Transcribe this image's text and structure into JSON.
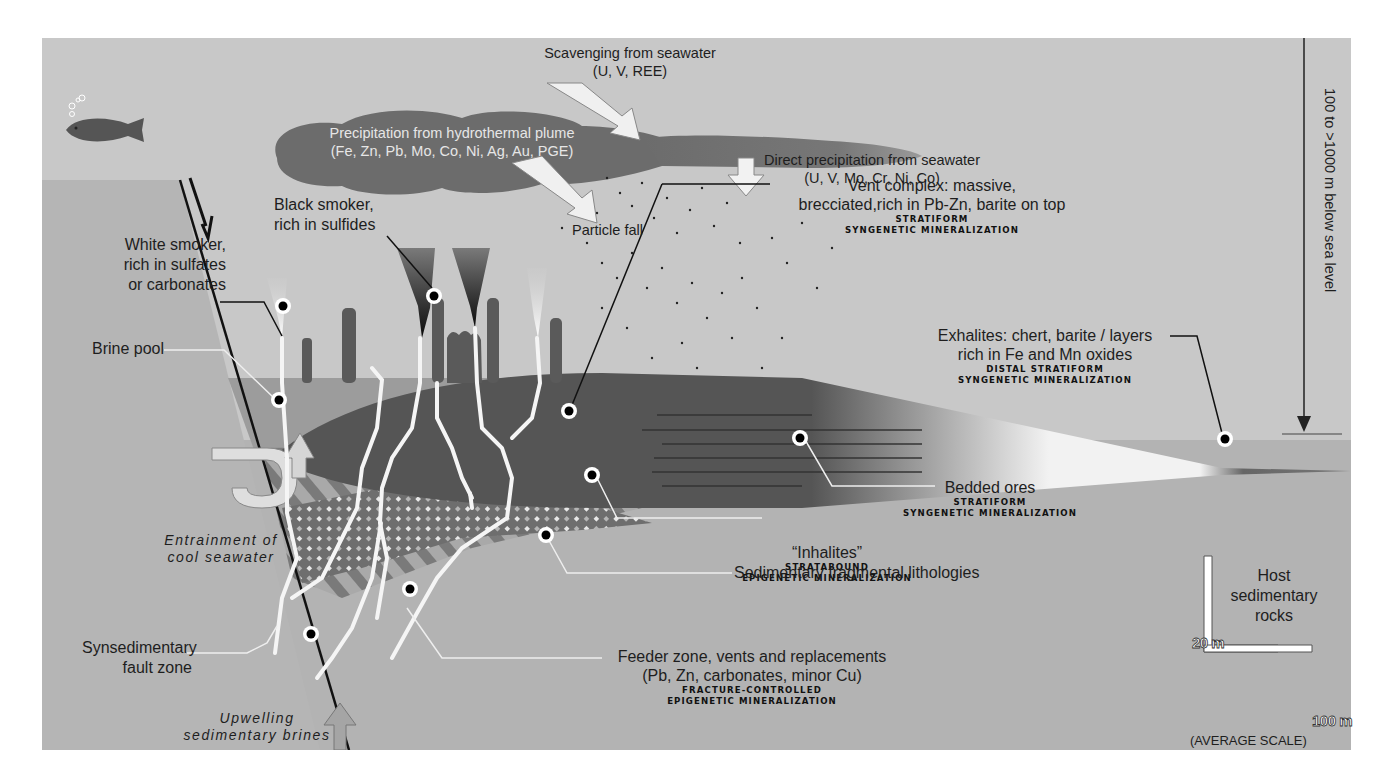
{
  "figure": {
    "type": "geological cross-section",
    "colors": {
      "seawater": "#c6c6c6",
      "sediment": "#b4b4b4",
      "plume": "#6f6f6f",
      "mound": "#5a5a5a",
      "brine_pool": "#9a9a9a",
      "marker_fill": "#000000",
      "marker_ring": "#ffffff"
    }
  },
  "labels": {
    "scavenging": {
      "line1": "Scavenging from seawater",
      "line2": "(U, V, REE)"
    },
    "plume": {
      "line1": "Precipitation from hydrothermal plume",
      "line2": "(Fe, Zn, Pb, Mo, Co, Ni, Ag, Au, PGE)"
    },
    "direct_precip": {
      "line1": "Direct precipitation from seawater",
      "line2": "(U, V, Mo, Cr, Ni, Co)"
    },
    "particle_fall": "Particle fall",
    "black_smoker": {
      "line1": "Black smoker,",
      "line2": "rich in sulfides"
    },
    "white_smoker": {
      "line1": "White smoker,",
      "line2": "rich in sulfates",
      "line3": "or carbonates"
    },
    "brine_pool": "Brine pool",
    "vent_complex": {
      "line1": "Vent complex: massive,",
      "line2": "brecciated,rich in Pb-Zn, barite on top",
      "class1": "STRATIFORM",
      "class2": "SYNGENETIC MINERALIZATION"
    },
    "exhalites": {
      "line1": "Exhalites: chert, barite / layers",
      "line2": "rich in Fe and Mn oxides",
      "class1": "DISTAL STRATIFORM",
      "class2": "SYNGENETIC MINERALIZATION"
    },
    "depth": "100 to >1000 m below sea level",
    "bedded_ores": {
      "line1": "Bedded ores",
      "class1": "STRATIFORM",
      "class2": "SYNGENETIC MINERALIZATION"
    },
    "inhalites": {
      "line1": "“Inhalites”",
      "class1": "STRATABOUND",
      "class2": "EPIGENETIC MINERALIZATION"
    },
    "fragmental": "Sedimentary fragmental lithologies",
    "entrainment": {
      "line1": "Entrainment of",
      "line2": "cool seawater"
    },
    "fault_zone": {
      "line1": "Synsedimentary",
      "line2": "fault zone"
    },
    "feeder_zone": {
      "line1": "Feeder zone, vents and replacements",
      "line2": "(Pb, Zn, carbonates, minor Cu)",
      "class1": "FRACTURE-CONTROLLED",
      "class2": "EPIGENETIC MINERALIZATION"
    },
    "upwelling": {
      "line1": "Upwelling",
      "line2": "sedimentary brines"
    },
    "host_rocks": {
      "line1": "Host",
      "line2": "sedimentary",
      "line3": "rocks"
    }
  },
  "scale_bar": {
    "vertical": "20 m",
    "horizontal": "100 m",
    "caption": "(AVERAGE SCALE)"
  },
  "icons": {
    "fish": "fish-icon",
    "bubbles": "bubbles-icon",
    "fault_arrow": "fault-motion-arrow-icon",
    "markers": "location-marker-icon"
  }
}
